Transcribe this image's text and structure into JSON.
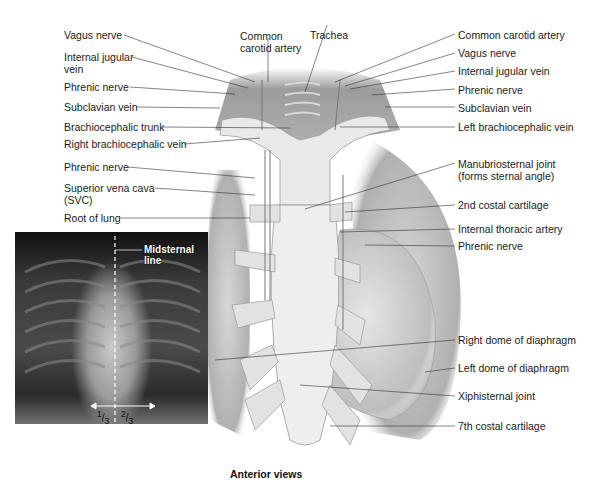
{
  "figure": {
    "caption": "Anterior views",
    "left_labels": [
      {
        "id": "vagus-nerve-right",
        "text": "Vagus nerve"
      },
      {
        "id": "internal-jugular-vein-right",
        "text": "Internal jugular\nvein",
        "line1": "Internal jugular",
        "line2": "vein"
      },
      {
        "id": "phrenic-nerve-right-upper",
        "text": "Phrenic nerve"
      },
      {
        "id": "subclavian-vein-right",
        "text": "Subclavian vein"
      },
      {
        "id": "brachiocephalic-trunk",
        "text": "Brachiocephalic trunk"
      },
      {
        "id": "right-brachiocephalic-vein",
        "text": "Right brachiocephalic vein"
      },
      {
        "id": "phrenic-nerve-right-lower",
        "text": "Phrenic nerve"
      },
      {
        "id": "superior-vena-cava",
        "line1": "Superior vena cava",
        "line2": "(SVC)"
      },
      {
        "id": "root-of-lung",
        "text": "Root of lung"
      }
    ],
    "top_labels": [
      {
        "id": "common-carotid-artery-top",
        "line1": "Common",
        "line2": "carotid artery"
      },
      {
        "id": "trachea",
        "text": "Trachea"
      }
    ],
    "right_labels": [
      {
        "id": "common-carotid-artery-left",
        "text": "Common carotid artery"
      },
      {
        "id": "vagus-nerve-left",
        "text": "Vagus nerve"
      },
      {
        "id": "internal-jugular-vein-left",
        "text": "Internal jugular vein"
      },
      {
        "id": "phrenic-nerve-left-upper",
        "text": "Phrenic nerve"
      },
      {
        "id": "subclavian-vein-left",
        "text": "Subclavian vein"
      },
      {
        "id": "left-brachiocephalic-vein",
        "text": "Left brachiocephalic vein"
      },
      {
        "id": "manubriosternal-joint",
        "line1": "Manubriosternal joint",
        "line2": "(forms sternal angle)"
      },
      {
        "id": "2nd-costal-cartilage",
        "text": "2nd costal cartilage"
      },
      {
        "id": "internal-thoracic-artery",
        "text": "Internal thoracic artery"
      },
      {
        "id": "phrenic-nerve-left-lower",
        "text": "Phrenic nerve"
      },
      {
        "id": "right-dome-of-diaphragm",
        "text": "Right dome of diaphragm"
      },
      {
        "id": "left-dome-of-diaphragm",
        "text": "Left dome of diaphragm"
      },
      {
        "id": "xiphisternal-joint",
        "text": "Xiphisternal joint"
      },
      {
        "id": "7th-costal-cartilage",
        "text": "7th costal cartilage"
      }
    ],
    "xray": {
      "midsternal_label_line1": "Midsternal",
      "midsternal_label_line2": "line",
      "fraction_left": "1/3",
      "fraction_right": "2/3",
      "frac_left_num": "1",
      "frac_left_den": "3",
      "frac_right_num": "2",
      "frac_right_den": "3"
    }
  }
}
